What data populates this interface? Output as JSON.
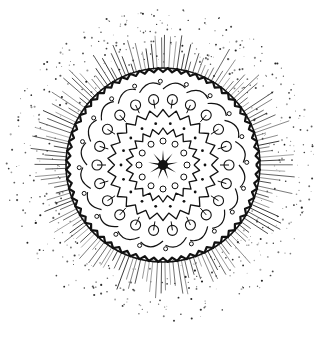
{
  "image": {
    "subject": "Hand-drawn black ink mandala / sun doodle with radiating spikes and speckled halo",
    "width": 315,
    "height": 341,
    "background": "#ffffff",
    "ink": "#111111"
  },
  "mandala": {
    "center": [
      163,
      165
    ],
    "outer_radius": 96,
    "halo": {
      "dot_count": 520,
      "inner": 100,
      "outer": 158,
      "seed": 7
    },
    "spikes": {
      "count": 150,
      "min_len": 10,
      "max_len": 38
    },
    "rings": [
      {
        "type": "zigzag-border",
        "r": 95,
        "teeth": 64,
        "amp": 4
      },
      {
        "type": "wave-curls",
        "r": 82,
        "count": 20,
        "amp": 6
      },
      {
        "type": "loops",
        "r": 66,
        "count": 22,
        "size": 5
      },
      {
        "type": "zigzag",
        "r": 52,
        "teeth": 26,
        "amp": 7
      },
      {
        "type": "dots",
        "r": 42,
        "count": 18,
        "size": 1.4
      },
      {
        "type": "zigzag",
        "r": 34,
        "teeth": 22,
        "amp": 6
      },
      {
        "type": "small-circles",
        "r": 24,
        "count": 12,
        "size": 3
      }
    ],
    "core_star": {
      "points": 9,
      "outer": 15,
      "inner": 3,
      "core_radius": 5
    }
  }
}
